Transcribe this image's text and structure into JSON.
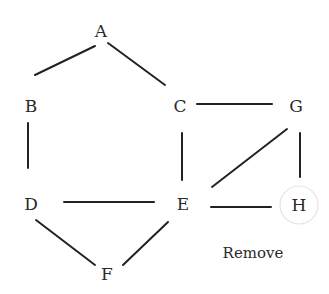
{
  "diagram": {
    "type": "graph",
    "nodes": [
      {
        "id": "A",
        "label": "A",
        "x": 101,
        "y": 31
      },
      {
        "id": "B",
        "label": "B",
        "x": 31,
        "y": 106
      },
      {
        "id": "C",
        "label": "C",
        "x": 180,
        "y": 106
      },
      {
        "id": "G",
        "label": "G",
        "x": 296,
        "y": 106
      },
      {
        "id": "D",
        "label": "D",
        "x": 31,
        "y": 204
      },
      {
        "id": "E",
        "label": "E",
        "x": 183,
        "y": 204
      },
      {
        "id": "H",
        "label": "H",
        "x": 299,
        "y": 205,
        "highlighted": true
      },
      {
        "id": "F",
        "label": "F",
        "x": 107,
        "y": 274
      }
    ],
    "edges": [
      {
        "from": "A",
        "to": "B",
        "x1": 35,
        "y1": 75,
        "x2": 95,
        "y2": 46
      },
      {
        "from": "A",
        "to": "C",
        "x1": 108,
        "y1": 43,
        "x2": 165,
        "y2": 85
      },
      {
        "from": "B",
        "to": "D",
        "x1": 28,
        "y1": 123,
        "x2": 28,
        "y2": 168
      },
      {
        "from": "C",
        "to": "G",
        "x1": 197,
        "y1": 104,
        "x2": 272,
        "y2": 104
      },
      {
        "from": "C",
        "to": "E",
        "x1": 182,
        "y1": 133,
        "x2": 182,
        "y2": 180
      },
      {
        "from": "G",
        "to": "E",
        "x1": 212,
        "y1": 187,
        "x2": 287,
        "y2": 129
      },
      {
        "from": "G",
        "to": "H",
        "x1": 300,
        "y1": 133,
        "x2": 300,
        "y2": 177
      },
      {
        "from": "D",
        "to": "E",
        "x1": 64,
        "y1": 202,
        "x2": 154,
        "y2": 202
      },
      {
        "from": "E",
        "to": "H",
        "x1": 211,
        "y1": 207,
        "x2": 271,
        "y2": 207
      },
      {
        "from": "D",
        "to": "F",
        "x1": 36,
        "y1": 220,
        "x2": 95,
        "y2": 265
      },
      {
        "from": "F",
        "to": "E",
        "x1": 123,
        "y1": 265,
        "x2": 168,
        "y2": 222
      }
    ],
    "highlight": {
      "node": "H",
      "cx": 299,
      "cy": 205,
      "r": 19,
      "color": "#e4e4e4"
    },
    "caption": {
      "text": "Remove",
      "x": 253,
      "y": 258
    }
  },
  "colors": {
    "edge": "#222222",
    "text": "#2a2a2a",
    "highlight_ring": "#e4e4e4",
    "background": "#ffffff"
  }
}
